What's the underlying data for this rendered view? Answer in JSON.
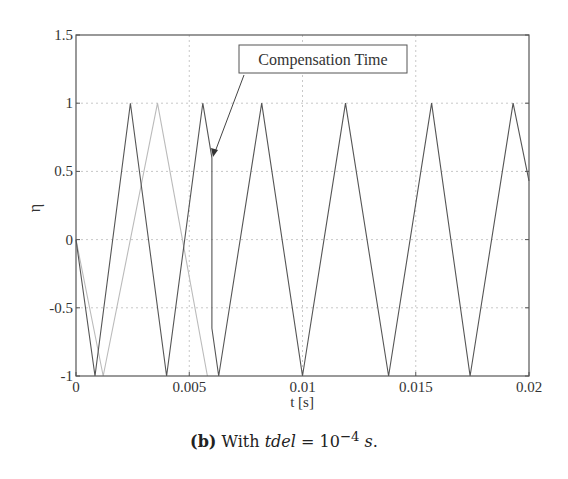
{
  "chart_data": {
    "type": "line",
    "title": "",
    "xlabel": "t [s]",
    "ylabel": "η",
    "xlim": [
      0,
      0.02
    ],
    "ylim": [
      -1,
      1.5
    ],
    "xticks": [
      0,
      0.005,
      0.01,
      0.015,
      0.02
    ],
    "xtick_labels": [
      "0",
      "0.005",
      "0.01",
      "0.015",
      "0.02"
    ],
    "yticks": [
      -1,
      -0.5,
      0,
      0.5,
      1,
      1.5
    ],
    "ytick_labels": [
      "-1",
      "-0.5",
      "0",
      "0.5",
      "1",
      "1.5"
    ],
    "grid": true,
    "legend": null,
    "series": [
      {
        "name": "compensated carrier (dark)",
        "color": "#555555",
        "x": [
          0,
          0.00084,
          0.0024,
          0.004,
          0.0056,
          0.006,
          0.006,
          0.0063,
          0.0082,
          0.01,
          0.0119,
          0.0138,
          0.0157,
          0.0174,
          0.0193,
          0.02
        ],
        "y": [
          0,
          -1,
          1,
          -1,
          1,
          0.6,
          -0.65,
          -1,
          1,
          -1,
          1,
          -1,
          1,
          -1,
          1,
          0.43
        ]
      },
      {
        "name": "delayed carrier (light)",
        "color": "#bbbbbb",
        "x": [
          0,
          0.0012,
          0.0036,
          0.0058
        ],
        "y": [
          0,
          -1,
          1,
          -1
        ]
      }
    ],
    "annotations": [
      {
        "text": "Compensation Time",
        "arrow_to": [
          0.006,
          0.6
        ]
      }
    ]
  },
  "annotation": {
    "label": "Compensation Time"
  },
  "axes": {
    "xlabel": "t [s]",
    "ylabel": "η",
    "xtick_labels": [
      "0",
      "0.005",
      "0.01",
      "0.015",
      "0.02"
    ],
    "ytick_labels": [
      "-1",
      "-0.5",
      "0",
      "0.5",
      "1",
      "1.5"
    ]
  },
  "caption": {
    "label": "(b)",
    "text_before": " With ",
    "var": "tdel",
    "equals": " = 10",
    "exponent": "−4",
    "unit": " s",
    "period": "."
  }
}
